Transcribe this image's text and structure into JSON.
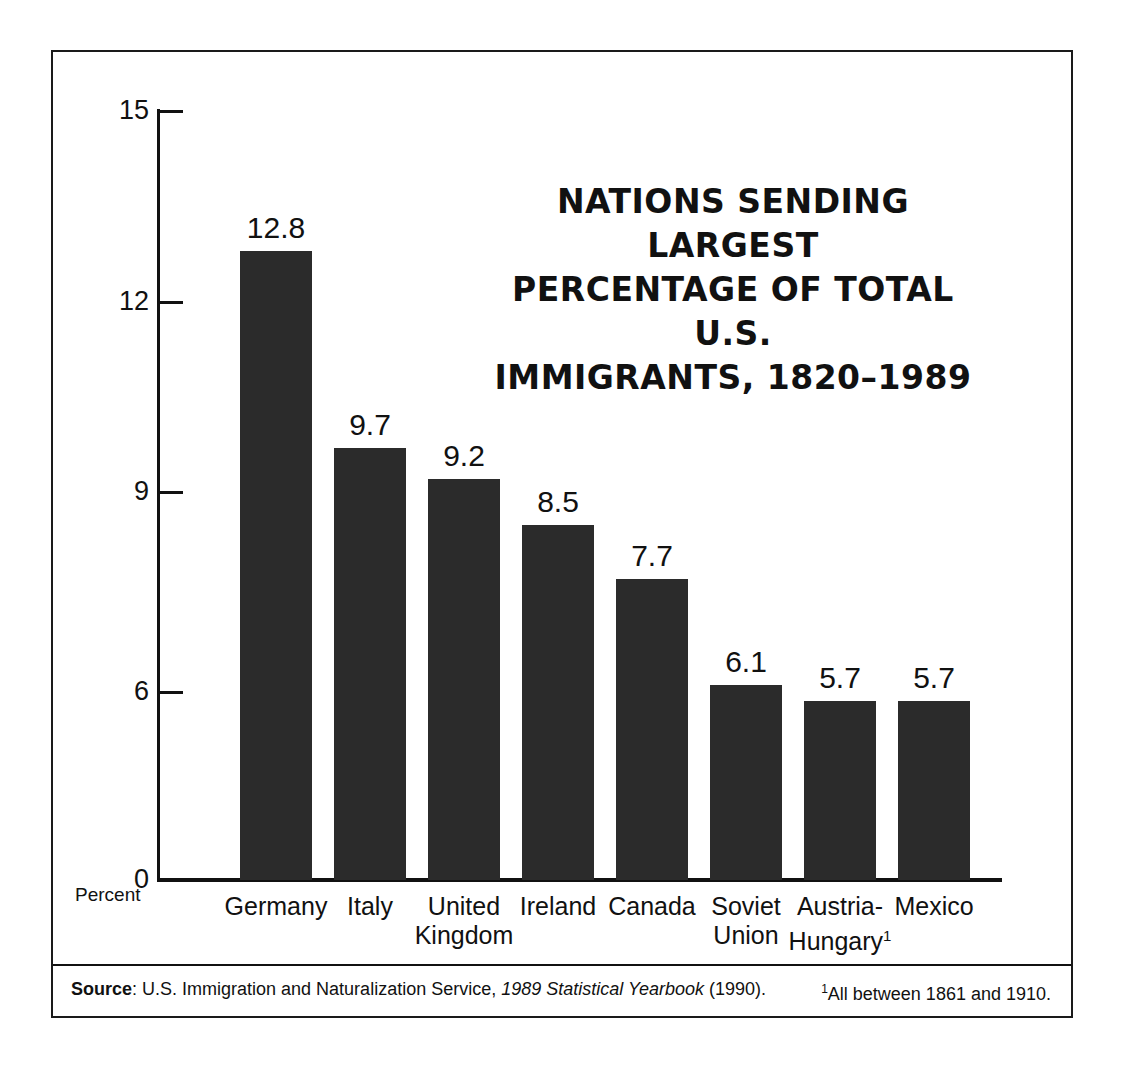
{
  "chart_data": {
    "type": "bar",
    "title_lines": [
      "NATIONS SENDING LARGEST",
      "PERCENTAGE OF TOTAL U.S.",
      "IMMIGRANTS, 1820–1989"
    ],
    "categories": [
      "Germany",
      "Italy",
      "United Kingdom",
      "Ireland",
      "Canada",
      "Soviet Union",
      "Austria-Hungary¹",
      "Mexico"
    ],
    "category_lines": [
      [
        "Germany",
        ""
      ],
      [
        "Italy",
        ""
      ],
      [
        "United",
        "Kingdom"
      ],
      [
        "Ireland",
        ""
      ],
      [
        "Canada",
        ""
      ],
      [
        "Soviet",
        "Union"
      ],
      [
        "Austria-",
        "Hungary¹"
      ],
      [
        "Mexico",
        ""
      ]
    ],
    "values": [
      12.8,
      9.7,
      9.2,
      8.5,
      7.7,
      6.1,
      5.7,
      5.7
    ],
    "value_labels": [
      "12.8",
      "9.7",
      "9.2",
      "8.5",
      "7.7",
      "6.1",
      "5.7",
      "5.7"
    ],
    "xlabel": "",
    "ylabel": "Percent",
    "ylim": [
      0,
      15
    ],
    "yticks": [
      15,
      12,
      9,
      6,
      0
    ],
    "ytick_labels": [
      "15",
      "12",
      "9",
      "6",
      "0"
    ],
    "grid": false,
    "legend": "none",
    "bar_color": "#2b2b2b"
  },
  "axis": {
    "y_unit_label": "Percent"
  },
  "footer": {
    "source_bold": "Source",
    "source_rest_1": ": U.S. Immigration and Naturalization Service, ",
    "source_italic": "1989 Statistical Yearbook",
    "source_rest_2": " (1990).",
    "footnote_marker": "1",
    "footnote_text": "All between 1861 and 1910."
  }
}
